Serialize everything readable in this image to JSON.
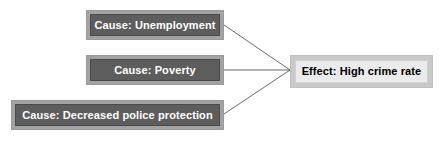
{
  "diagram": {
    "type": "cause-and-effect",
    "background_color": "#ffffff",
    "cause_nodes": [
      {
        "id": "unemployment",
        "label": "Cause: Unemployment",
        "fill_color": "#5d5d5d",
        "frame_color": "#a3a3a3",
        "text_color": "#ffffff"
      },
      {
        "id": "poverty",
        "label": "Cause: Poverty",
        "fill_color": "#5d5d5d",
        "frame_color": "#a3a3a3",
        "text_color": "#ffffff"
      },
      {
        "id": "police-protection",
        "label": "Cause: Decreased police protection",
        "fill_color": "#5d5d5d",
        "frame_color": "#a3a3a3",
        "text_color": "#ffffff"
      }
    ],
    "effect_node": {
      "id": "high-crime-rate",
      "label": "Effect: High crime rate",
      "fill_color": "#ebebeb",
      "frame_color": "#c9c9c9",
      "text_color": "#000000"
    },
    "connectors": [
      {
        "id": "unemployment-to-effect",
        "from": "unemployment",
        "to": "high-crime-rate",
        "color": "#6b6b6b"
      },
      {
        "id": "poverty-to-effect",
        "from": "poverty",
        "to": "high-crime-rate",
        "color": "#6b6b6b"
      },
      {
        "id": "police-protection-to-effect",
        "from": "police-protection",
        "to": "high-crime-rate",
        "color": "#6b6b6b"
      }
    ]
  }
}
